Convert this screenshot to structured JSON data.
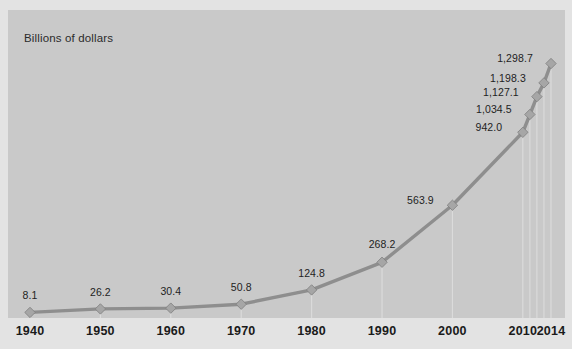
{
  "figure": {
    "clipped_top_caption": "",
    "axis_note": "Billions of dollars",
    "background_color": "#e3e3e3",
    "plot_background_color": "#c9c9c9",
    "line_color": "#8e8e8e",
    "marker_color": "#a6a6a6",
    "gridline_color": "#dcdcdc",
    "label_color": "#1e1e1e"
  },
  "chart_data": {
    "type": "line",
    "title": "",
    "subtitle": "",
    "xlabel": "",
    "ylabel": "Billions of dollars",
    "grid": "vertical-dropline-per-point",
    "legend": "none",
    "ylim": [
      0,
      1400
    ],
    "xlim": [
      1940,
      2014
    ],
    "tick_labels": [
      "1940",
      "1950",
      "1960",
      "1970",
      "1980",
      "1990",
      "2000",
      "2010",
      "2014"
    ],
    "ticks": [
      1940,
      1950,
      1960,
      1970,
      1980,
      1990,
      2000,
      2010,
      2014
    ],
    "x": [
      1940,
      1950,
      1960,
      1970,
      1980,
      1990,
      2000,
      2010,
      2011,
      2012,
      2013,
      2014
    ],
    "values": [
      8.1,
      26.2,
      30.4,
      50.8,
      124.8,
      268.2,
      563.9,
      942.0,
      1034.5,
      1127.1,
      1198.3,
      1298.7
    ],
    "data_labels": [
      "8.1",
      "26.2",
      "30.4",
      "50.8",
      "124.8",
      "268.2",
      "563.9",
      "942.0",
      "1,034.5",
      "1,127.1",
      "1,198.3",
      "1,298.7"
    ],
    "labeled_points": [
      {
        "x": 1940,
        "value": 8.1,
        "label": "8.1"
      },
      {
        "x": 1950,
        "value": 26.2,
        "label": "26.2"
      },
      {
        "x": 1960,
        "value": 30.4,
        "label": "30.4"
      },
      {
        "x": 1970,
        "value": 50.8,
        "label": "50.8"
      },
      {
        "x": 1980,
        "value": 124.8,
        "label": "124.8"
      },
      {
        "x": 1990,
        "value": 268.2,
        "label": "268.2"
      },
      {
        "x": 2000,
        "value": 563.9,
        "label": "563.9"
      },
      {
        "x": 2010,
        "value": 942.0,
        "label": "942.0"
      },
      {
        "x": 2011,
        "value": 1034.5,
        "label": "1,034.5"
      },
      {
        "x": 2012,
        "value": 1127.1,
        "label": "1,127.1"
      },
      {
        "x": 2013,
        "value": 1198.3,
        "label": "1,198.3"
      },
      {
        "x": 2014,
        "value": 1298.7,
        "label": "1,298.7"
      }
    ]
  }
}
